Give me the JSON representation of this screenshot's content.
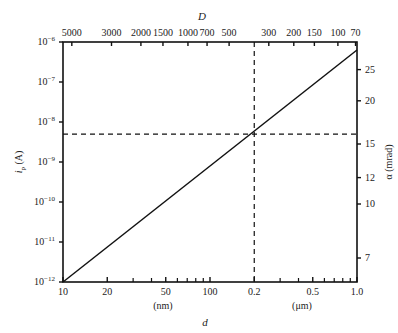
{
  "chart_data": {
    "type": "line",
    "title": "",
    "xlabel": "d",
    "xlabel_units": [
      "(nm)",
      "(μm)"
    ],
    "ylabel": "i_p (A)",
    "top_axis_label": "D",
    "right_axis_label": "α (mrad)",
    "x_scale": "log",
    "y_scale": "log",
    "xlim_nm": [
      10,
      1000
    ],
    "ylim": [
      1e-12,
      1e-06
    ],
    "bottom_ticks": [
      {
        "label": "10",
        "value_nm": 10
      },
      {
        "label": "20",
        "value_nm": 20
      },
      {
        "label": "50",
        "value_nm": 50
      },
      {
        "label": "100",
        "value_nm": 100
      },
      {
        "label": "0.2",
        "value_nm": 200
      },
      {
        "label": "0.5",
        "value_nm": 500
      },
      {
        "label": "1.0",
        "value_nm": 1000
      }
    ],
    "bottom_minor_ticks_nm": [
      30,
      40,
      60,
      70,
      80,
      90,
      300,
      400,
      600,
      700,
      800,
      900
    ],
    "left_ticks": [
      {
        "label": "10",
        "exp": "−12",
        "value": 1e-12
      },
      {
        "label": "10",
        "exp": "−11",
        "value": 1e-11
      },
      {
        "label": "10",
        "exp": "−10",
        "value": 1e-10
      },
      {
        "label": "10",
        "exp": "−9",
        "value": 1e-09
      },
      {
        "label": "10",
        "exp": "−8",
        "value": 1e-08
      },
      {
        "label": "10",
        "exp": "−7",
        "value": 1e-07
      },
      {
        "label": "10",
        "exp": "−6",
        "value": 1e-06
      }
    ],
    "top_ticks": [
      {
        "label": "5000",
        "frac": 0.03
      },
      {
        "label": "3000",
        "frac": 0.165
      },
      {
        "label": "2000",
        "frac": 0.265
      },
      {
        "label": "1500",
        "frac": 0.34
      },
      {
        "label": "1000",
        "frac": 0.425
      },
      {
        "label": "700",
        "frac": 0.49
      },
      {
        "label": "500",
        "frac": 0.565
      },
      {
        "label": "300",
        "frac": 0.7
      },
      {
        "label": "200",
        "frac": 0.785
      },
      {
        "label": "150",
        "frac": 0.855
      },
      {
        "label": "100",
        "frac": 0.935
      },
      {
        "label": "70",
        "frac": 0.995
      }
    ],
    "right_ticks": [
      {
        "label": "25",
        "frac": 0.885
      },
      {
        "label": "20",
        "frac": 0.755
      },
      {
        "label": "15",
        "frac": 0.575
      },
      {
        "label": "12",
        "frac": 0.435
      },
      {
        "label": "10",
        "frac": 0.325
      },
      {
        "label": "7",
        "frac": 0.1
      }
    ],
    "series": [
      {
        "name": "i_p vs d",
        "style": "solid",
        "points": [
          {
            "d_nm": 10,
            "i_p": 1e-12
          },
          {
            "d_nm": 200,
            "i_p": 5e-09
          },
          {
            "d_nm": 1000,
            "i_p": 5e-07
          }
        ]
      }
    ],
    "reference_lines": [
      {
        "type": "vertical",
        "d_nm": 200,
        "style": "dashed"
      },
      {
        "type": "horizontal",
        "i_p": 5e-09,
        "style": "dashed"
      }
    ],
    "grid": false,
    "legend": null
  }
}
